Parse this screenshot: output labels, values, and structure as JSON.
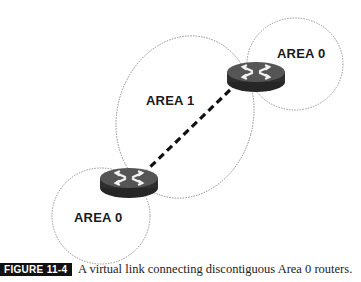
{
  "diagram": {
    "areas": [
      {
        "id": "area0-right",
        "label": "AREA 0",
        "cx": 295,
        "cy": 64,
        "rx": 48,
        "ry": 46,
        "rotate": 0
      },
      {
        "id": "area1",
        "label": "AREA 1",
        "cx": 185,
        "cy": 117,
        "rx": 68,
        "ry": 82,
        "rotate": 15
      },
      {
        "id": "area0-left",
        "label": "AREA 0",
        "cx": 101,
        "cy": 216,
        "rx": 49,
        "ry": 48,
        "rotate": 0
      }
    ],
    "routers": [
      {
        "id": "router-right",
        "cx": 256,
        "cy": 72
      },
      {
        "id": "router-left",
        "cx": 129,
        "cy": 178
      }
    ],
    "virtual_link": {
      "x1": 230,
      "y1": 90,
      "x2": 147,
      "y2": 170,
      "style": "dashed"
    },
    "labels": {
      "area0_right": "AREA 0",
      "area1": "AREA 1",
      "area0_left": "AREA 0"
    }
  },
  "caption": {
    "figure_number": "FIGURE 11-4",
    "text": "A virtual link connecting discontiguous Area 0 routers."
  },
  "colors": {
    "outline": "#8a8a8a",
    "router_top": "#4a4a4a",
    "router_side": "#2a2a2a",
    "link": "#111111"
  }
}
